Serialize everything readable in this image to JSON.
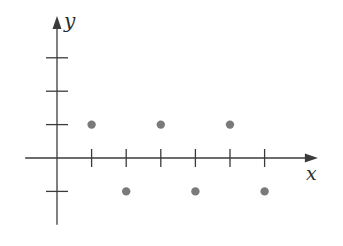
{
  "figure": {
    "background": "#ffffff"
  },
  "chart_data": {
    "type": "scatter",
    "title": "",
    "xlabel": "x",
    "ylabel": "y",
    "points": [
      {
        "x": 1,
        "y": 1
      },
      {
        "x": 2,
        "y": -1
      },
      {
        "x": 3,
        "y": 1
      },
      {
        "x": 4,
        "y": -1
      },
      {
        "x": 5,
        "y": 1
      },
      {
        "x": 6,
        "y": -1
      }
    ],
    "x_ticks": [
      1,
      2,
      3,
      4,
      5,
      6
    ],
    "y_ticks": [
      -1,
      1,
      2,
      3
    ],
    "x_tick_labels": [
      "",
      "",
      "",
      "",
      "",
      ""
    ],
    "y_tick_labels": [
      "",
      "",
      "",
      ""
    ],
    "xlim": [
      -0.92,
      7.54
    ],
    "ylim": [
      -2.0,
      4.25
    ],
    "grid": false,
    "legend": false,
    "axis_color": "#3b3b3b",
    "point_color": "#7a7a7a"
  }
}
